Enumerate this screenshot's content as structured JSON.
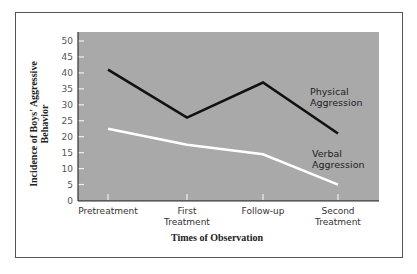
{
  "chart_data": {
    "type": "line",
    "title": "",
    "xlabel": "Times of Observation",
    "ylabel": "Incidence of Boys' Aggressive Behavior",
    "ylabel_lines": [
      "Incidence of Boys' Aggressive",
      "Behavior"
    ],
    "categories": [
      "Pretreatment",
      "First Treatment",
      "Follow-up",
      "Second Treatment"
    ],
    "category_lines": [
      [
        "Pretreatment"
      ],
      [
        "First",
        "Treatment"
      ],
      [
        "Follow-up"
      ],
      [
        "Second",
        "Treatment"
      ]
    ],
    "yticks": [
      0,
      5,
      10,
      15,
      20,
      25,
      30,
      35,
      40,
      45,
      50
    ],
    "ylim": [
      0,
      52
    ],
    "grid": false,
    "legend_position": "inline-right",
    "series": [
      {
        "name": "Physical Aggression",
        "label_lines": [
          "Physical",
          "Aggression"
        ],
        "values": [
          41,
          26,
          37,
          21
        ],
        "color": "#111111"
      },
      {
        "name": "Verbal Aggression",
        "label_lines": [
          "Verbal",
          "Aggression"
        ],
        "values": [
          22.5,
          17.5,
          14.5,
          5
        ],
        "color": "#ffffff"
      }
    ],
    "colors": {
      "plot_background": "#a9a9a9",
      "frame": "#555555",
      "axis": "#333333",
      "tick": "#f0f0f0"
    }
  }
}
